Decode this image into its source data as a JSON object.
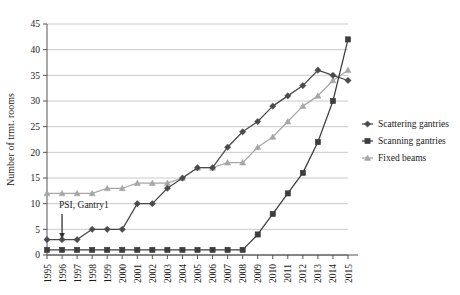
{
  "chart_data": {
    "type": "line",
    "title": "",
    "xlabel": "",
    "ylabel": "Number of trmt. rooms",
    "x": [
      1995,
      1996,
      1997,
      1998,
      1999,
      2000,
      2001,
      2002,
      2003,
      2004,
      2005,
      2006,
      2007,
      2008,
      2009,
      2010,
      2011,
      2012,
      2013,
      2014,
      2015
    ],
    "categories": [
      "1995",
      "1996",
      "1997",
      "1998",
      "1999",
      "2000",
      "2001",
      "2002",
      "2003",
      "2004",
      "2005",
      "2006",
      "2007",
      "2008",
      "2009",
      "2010",
      "2011",
      "2012",
      "2013",
      "2014",
      "2015"
    ],
    "series": [
      {
        "name": "Scattering gantries",
        "color": "#4a4a4a",
        "marker": "diamond",
        "values": [
          3,
          3,
          3,
          5,
          5,
          5,
          10,
          10,
          13,
          15,
          17,
          17,
          21,
          24,
          26,
          29,
          31,
          33,
          36,
          35,
          34
        ]
      },
      {
        "name": "Scanning gantries",
        "color": "#3d3d3d",
        "marker": "square",
        "values": [
          1,
          1,
          1,
          1,
          1,
          1,
          1,
          1,
          1,
          1,
          1,
          1,
          1,
          1,
          4,
          8,
          12,
          16,
          22,
          30,
          42
        ]
      },
      {
        "name": "Fixed beams",
        "color": "#a6a6a6",
        "marker": "triangle",
        "values": [
          12,
          12,
          12,
          12,
          13,
          13,
          14,
          14,
          14,
          15,
          17,
          17,
          18,
          18,
          21,
          23,
          26,
          29,
          31,
          34,
          36
        ]
      }
    ],
    "ylim": [
      0,
      45
    ],
    "yticks": [
      0,
      5,
      10,
      15,
      20,
      25,
      30,
      35,
      40,
      45
    ],
    "ytick_labels": [
      "0",
      "5",
      "10",
      "15",
      "20",
      "25",
      "30",
      "35",
      "40",
      "45"
    ],
    "grid": true,
    "grid_axis": "y",
    "legend_position": "right",
    "annotations": [
      {
        "name": "psi-gantry1",
        "text": "PSI, Gantry1",
        "points_to_x": 1996,
        "points_to_y": 3
      }
    ]
  },
  "legend": {
    "entries": [
      {
        "label": "Scattering gantries"
      },
      {
        "label": "Scanning gantries"
      },
      {
        "label": "Fixed beams"
      }
    ]
  }
}
